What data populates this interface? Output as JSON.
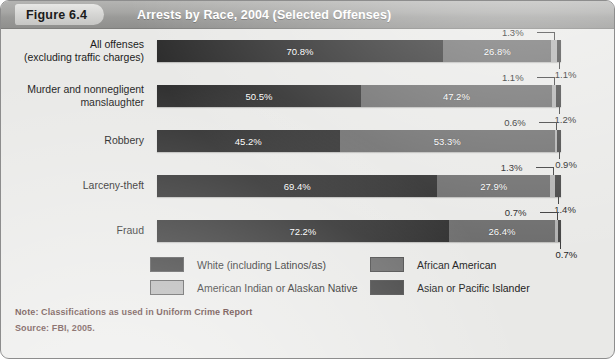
{
  "header": {
    "figure_tag": "Figure 6.4",
    "title": "Arrests by Race, 2004 (Selected Offenses)"
  },
  "footer": {
    "note": "Note: Classifications as used in Uniform Crime Report",
    "source": "Source: FBI, 2005."
  },
  "colors": {
    "white_race": "#2c2c2c",
    "african_american": "#6b6b6b",
    "american_indian": "#b0b0b0",
    "asian_pacific": "#414141",
    "header_bar": "#9f9f9d",
    "panel_bg": "#e9e9e7",
    "note_text": "#4a1f1c"
  },
  "legend": {
    "items": [
      {
        "label": "White (including Latinos/as)",
        "color": "#2c2c2c"
      },
      {
        "label": "African American",
        "color": "#6b6b6b"
      },
      {
        "label": "American Indian or Alaskan Native",
        "color": "#b0b0b0"
      },
      {
        "label": "Asian or Pacific Islander",
        "color": "#414141"
      }
    ]
  },
  "chart_data": {
    "type": "bar",
    "orientation": "horizontal",
    "stacked": true,
    "normalized_percent": true,
    "title": "Arrests by Race, 2004 (Selected Offenses)",
    "xlabel": "",
    "ylabel": "",
    "xlim": [
      0,
      100
    ],
    "grid": false,
    "legend_position": "bottom",
    "units": "percent",
    "categories": [
      "All offenses (excluding traffic charges)",
      "Murder and nonnegligent manslaughter",
      "Robbery",
      "Larceny-theft",
      "Fraud"
    ],
    "series": [
      {
        "name": "White (including Latinos/as)",
        "values": [
          70.8,
          50.5,
          45.2,
          69.4,
          72.2
        ]
      },
      {
        "name": "African American",
        "values": [
          26.8,
          47.2,
          53.3,
          27.9,
          26.4
        ]
      },
      {
        "name": "American Indian or Alaskan Native",
        "values": [
          1.3,
          1.1,
          0.6,
          1.3,
          0.7
        ]
      },
      {
        "name": "Asian or Pacific Islander",
        "values": [
          1.1,
          1.2,
          0.9,
          1.4,
          0.7
        ]
      }
    ],
    "rows": [
      {
        "label_line1": "All offenses",
        "label_line2": "(excluding traffic charges)",
        "white": "70.8%",
        "african_american": "26.8%",
        "american_indian": "1.3%",
        "asian_pacific": "1.1%"
      },
      {
        "label_line1": "Murder and nonnegligent",
        "label_line2": "manslaughter",
        "white": "50.5%",
        "african_american": "47.2%",
        "american_indian": "1.1%",
        "asian_pacific": "1.2%"
      },
      {
        "label_line1": "Robbery",
        "label_line2": "",
        "white": "45.2%",
        "african_american": "53.3%",
        "american_indian": "0.6%",
        "asian_pacific": "0.9%"
      },
      {
        "label_line1": "Larceny-theft",
        "label_line2": "",
        "white": "69.4%",
        "african_american": "27.9%",
        "american_indian": "1.3%",
        "asian_pacific": "1.4%"
      },
      {
        "label_line1": "Fraud",
        "label_line2": "",
        "white": "72.2%",
        "african_american": "26.4%",
        "american_indian": "0.7%",
        "asian_pacific": "0.7%"
      }
    ]
  }
}
